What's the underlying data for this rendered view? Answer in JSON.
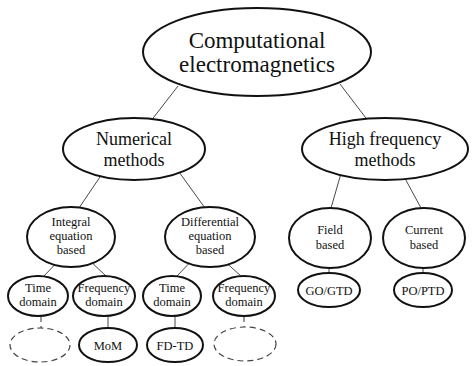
{
  "diagram": {
    "type": "tree",
    "root": {
      "line1": "Computational",
      "line2": "electromagnetics"
    },
    "numerical": {
      "line1": "Numerical",
      "line2": "methods"
    },
    "high_freq": {
      "line1": "High frequency",
      "line2": "methods"
    },
    "integral": {
      "line1": "Integral",
      "line2": "equation",
      "line3": "based"
    },
    "differential": {
      "line1": "Differential",
      "line2": "equation",
      "line3": "based"
    },
    "field": {
      "line1": "Field",
      "line2": "based"
    },
    "current": {
      "line1": "Current",
      "line2": "based"
    },
    "ie_time": {
      "line1": "Time",
      "line2": "domain"
    },
    "ie_freq": {
      "line1": "Frequency",
      "line2": "domain"
    },
    "de_time": {
      "line1": "Time",
      "line2": "domain"
    },
    "de_freq": {
      "line1": "Frequency",
      "line2": "domain"
    },
    "go_gtd": {
      "label": "GO/GTD"
    },
    "po_ptd": {
      "label": "PO/PTD"
    },
    "mom": {
      "label": "MoM"
    },
    "fdtd": {
      "label": "FD-TD"
    },
    "ie_time_leaf": {
      "label": ""
    },
    "de_freq_leaf": {
      "label": ""
    }
  }
}
